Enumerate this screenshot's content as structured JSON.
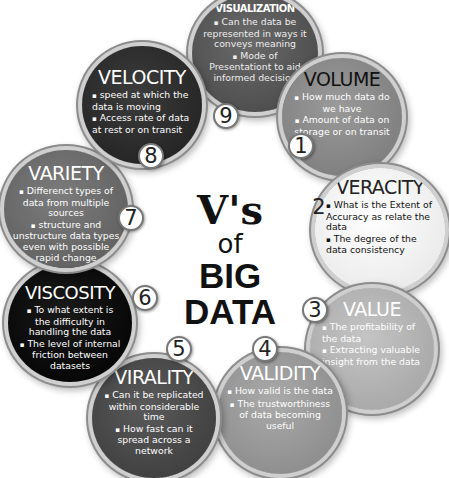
{
  "center": {
    "line1": "V's",
    "line2": "of",
    "line3": "BIG DATA"
  },
  "items": [
    {
      "number": "1",
      "title": "VOLUME",
      "bullets": [
        "How much data do we have",
        "Amount of data on storage or on transit"
      ],
      "color": "#8a8a8a"
    },
    {
      "number": "2",
      "title": "VERACITY",
      "bullets": [
        "What is the Extent of Accuracy as relate the data",
        "The degree of the data consistency"
      ],
      "color": "#f4f4f4"
    },
    {
      "number": "3",
      "title": "VALUE",
      "bullets": [
        "The profitability of the data",
        "Extracting valuable insight from the data"
      ],
      "color": "#b4b4b4"
    },
    {
      "number": "4",
      "title": "VALIDITY",
      "bullets": [
        "How valid is the data",
        "The trustworthiness of data becoming useful"
      ],
      "color": "#9a9a9a"
    },
    {
      "number": "5",
      "title": "VIRALITY",
      "bullets": [
        "Can it be replicated within considerable time",
        "How fast can it spread across a network"
      ],
      "color": "#4a4a4a"
    },
    {
      "number": "6",
      "title": "VISCOSITY",
      "bullets": [
        "To what extent is the difficulty in handling the data",
        "The level of internal friction between datasets"
      ],
      "color": "#0e0e0e"
    },
    {
      "number": "7",
      "title": "VARIETY",
      "bullets": [
        "Differenct types of data from multiple sources",
        "structure and unstructure data types even with possible rapid change"
      ],
      "color": "#6c6c6c"
    },
    {
      "number": "8",
      "title": "VELOCITY",
      "bullets": [
        "speed at which the data is moving",
        "Access rate of data at rest or on transit"
      ],
      "color": "#2c2c2c"
    },
    {
      "number": "9",
      "title": "VISUALIZATION",
      "bullets": [
        "Can the data be represented in ways it conveys meaning",
        "Mode of Presentationt to aid informed decision"
      ],
      "color": "#555555"
    }
  ]
}
